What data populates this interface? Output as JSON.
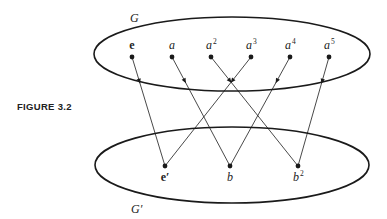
{
  "figure": {
    "caption": "FIGURE 3.2",
    "domain_group": {
      "label": "G",
      "ellipse": {
        "cx": 232,
        "cy": 54,
        "rx": 138,
        "ry": 37
      },
      "elements": [
        {
          "id": "e",
          "label": "e",
          "sup": "",
          "bold": true,
          "x": 132,
          "y": 57
        },
        {
          "id": "a",
          "label": "a",
          "sup": "",
          "bold": false,
          "x": 172,
          "y": 57
        },
        {
          "id": "a2",
          "label": "a",
          "sup": "2",
          "bold": false,
          "x": 211,
          "y": 57
        },
        {
          "id": "a3",
          "label": "a",
          "sup": "3",
          "bold": false,
          "x": 251,
          "y": 57
        },
        {
          "id": "a4",
          "label": "a",
          "sup": "4",
          "bold": false,
          "x": 290,
          "y": 57
        },
        {
          "id": "a5",
          "label": "a",
          "sup": "5",
          "bold": false,
          "x": 329,
          "y": 57
        }
      ]
    },
    "codomain_group": {
      "label": "G′",
      "ellipse": {
        "cx": 232,
        "cy": 165,
        "rx": 137,
        "ry": 38
      },
      "elements": [
        {
          "id": "e'",
          "label": "e′",
          "sup": "",
          "bold": true,
          "x": 165,
          "y": 166
        },
        {
          "id": "b",
          "label": "b",
          "sup": "",
          "bold": false,
          "x": 230,
          "y": 166
        },
        {
          "id": "b2",
          "label": "b",
          "sup": "2",
          "bold": false,
          "x": 298,
          "y": 166
        }
      ]
    },
    "mappings": [
      {
        "from": "e",
        "to": "e'"
      },
      {
        "from": "a",
        "to": "b"
      },
      {
        "from": "a2",
        "to": "b2"
      },
      {
        "from": "a3",
        "to": "e'"
      },
      {
        "from": "a4",
        "to": "b"
      },
      {
        "from": "a5",
        "to": "b2"
      }
    ],
    "colors": {
      "stroke": "#1a1a1a",
      "background": "#ffffff"
    }
  }
}
